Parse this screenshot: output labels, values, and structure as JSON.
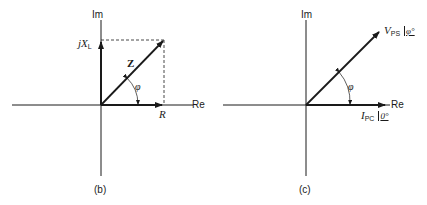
{
  "figures": [
    {
      "id": "b",
      "caption": "(b)",
      "axes": {
        "vertical": "Im",
        "horizontal": "Re"
      },
      "vectors": [
        {
          "name": "Z",
          "label": "Z",
          "style": "bold"
        },
        {
          "name": "jX_L",
          "label_prefix": "jX",
          "label_sub": "L"
        },
        {
          "name": "R",
          "label": "R"
        }
      ],
      "angle_label": "φ"
    },
    {
      "id": "c",
      "caption": "(c)",
      "axes": {
        "vertical": "Im",
        "horizontal": "Re"
      },
      "vectors": [
        {
          "name": "V_PS",
          "label_prefix": "V",
          "label_sub": "PS",
          "angle": "φ°"
        },
        {
          "name": "I_PC",
          "label_prefix": "I",
          "label_sub": "PC",
          "angle": "0°"
        }
      ],
      "angle_label": "φ"
    }
  ]
}
